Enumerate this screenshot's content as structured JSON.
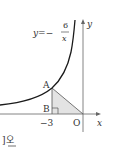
{
  "diagram": {
    "equation": {
      "lhs": "y=−",
      "numerator": "6",
      "denominator": "x"
    },
    "axes": {
      "x_label": "x",
      "y_label": "y",
      "origin_label": "O"
    },
    "points": {
      "A": "A",
      "B": "B"
    },
    "tick": "−3",
    "footer_text": "]오",
    "colors": {
      "curve": "#1a1a1a",
      "axis": "#555555",
      "triangle_fill": "#e6e6e6",
      "line": "#555555"
    }
  }
}
